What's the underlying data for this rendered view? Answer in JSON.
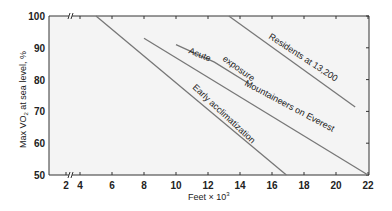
{
  "chart_data": {
    "type": "line",
    "title": "",
    "xlabel": "Feet × 10³",
    "ylabel": "Max VO₂ at sea level, %",
    "xlim": [
      2,
      22
    ],
    "ylim": [
      50,
      100
    ],
    "x_ticks": [
      2,
      4,
      6,
      8,
      10,
      12,
      14,
      16,
      18,
      20,
      22
    ],
    "y_ticks": [
      50,
      60,
      70,
      80,
      90,
      100
    ],
    "axis_break": "x-axis between 2 and 4",
    "grid": false,
    "legend": "none (inline labels)",
    "series": [
      {
        "name": "Early acclimatization",
        "points": [
          [
            5,
            100
          ],
          [
            16.9,
            50
          ]
        ]
      },
      {
        "name": "Mountaineers on Everest",
        "points": [
          [
            8,
            93
          ],
          [
            22,
            50
          ]
        ]
      },
      {
        "name": "Acute exposure",
        "points": [
          [
            10,
            91
          ],
          [
            12.4,
            85.5
          ],
          [
            14.6,
            78.6
          ]
        ]
      },
      {
        "name": "Residents at 13,200",
        "points": [
          [
            13.3,
            100
          ],
          [
            21.2,
            71.4
          ]
        ]
      }
    ]
  },
  "labels": {
    "ylabel_main": "Max VO",
    "ylabel_sub": "2",
    "ylabel_rest": " at sea level, %",
    "xlabel_main": "Feet × 10",
    "xlabel_sup": "3",
    "acute": "Acute",
    "exposure": "exposure",
    "residents": "Residents at 13,200",
    "mountaineers": "Mountaineers on Everest",
    "early": "Early acclimatization"
  },
  "colors": {
    "plot_bg": "#f4f4f4",
    "line": "#777777",
    "axis": "#333333",
    "text": "#222222"
  }
}
